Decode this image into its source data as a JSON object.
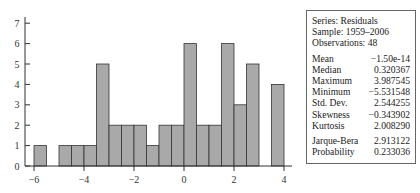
{
  "chart_data": {
    "type": "bar",
    "title": "",
    "xlabel": "",
    "ylabel": "",
    "bin_edges": [
      -6,
      -5.5,
      -5,
      -4.5,
      -4,
      -3.5,
      -3,
      -2.5,
      -2,
      -1.5,
      -1,
      -0.5,
      0,
      0.5,
      1,
      1.5,
      2,
      2.5,
      3,
      3.5,
      4
    ],
    "categories": [
      "-6 to -5.5",
      "-5.5 to -5",
      "-5 to -4.5",
      "-4.5 to -4",
      "-4 to -3.5",
      "-3.5 to -3",
      "-3 to -2.5",
      "-2.5 to -2",
      "-2 to -1.5",
      "-1.5 to -1",
      "-1 to -0.5",
      "-0.5 to 0",
      "0 to 0.5",
      "0.5 to 1",
      "1 to 1.5",
      "1.5 to 2",
      "2 to 2.5",
      "2.5 to 3",
      "3 to 3.5",
      "3.5 to 4"
    ],
    "values": [
      1,
      0,
      1,
      1,
      1,
      5,
      2,
      2,
      2,
      1,
      2,
      2,
      6,
      2,
      2,
      6,
      3,
      5,
      0,
      4
    ],
    "xlim": [
      -6,
      4
    ],
    "ylim": [
      0,
      7
    ],
    "x_ticks": [
      "-6",
      "-4",
      "-2",
      "0",
      "2",
      "4"
    ],
    "y_ticks": [
      "0",
      "1",
      "2",
      "3",
      "4",
      "5",
      "6",
      "7"
    ],
    "grid": false,
    "bar_color": "#a9a9a9",
    "edge_color": "#333333"
  },
  "stats": {
    "series": "Series: Residuals",
    "sample": "Sample: 1959–2006",
    "observations": "Observations: 48",
    "rows": [
      {
        "label": "Mean",
        "value": "−1.50e-14"
      },
      {
        "label": "Median",
        "value": "0.320367"
      },
      {
        "label": "Maximum",
        "value": "3.987545"
      },
      {
        "label": "Minimum",
        "value": "−5.531548"
      },
      {
        "label": "Std. Dev.",
        "value": "2.544255"
      },
      {
        "label": "Skewness",
        "value": "−0.343902"
      },
      {
        "label": "Kurtosis",
        "value": "2.008290"
      }
    ],
    "tests": [
      {
        "label": "Jarque-Bera",
        "value": "2.913122"
      },
      {
        "label": "Probability",
        "value": "0.233036"
      }
    ]
  }
}
